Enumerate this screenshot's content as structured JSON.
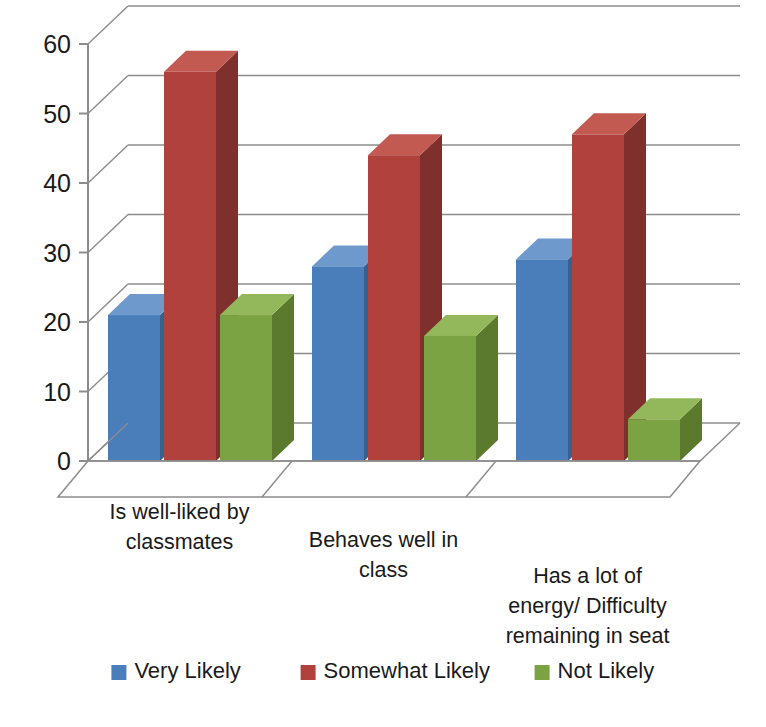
{
  "chart_data": {
    "type": "bar",
    "title": "",
    "subtitle": "",
    "xlabel": "",
    "ylabel": "",
    "ylim": [
      0,
      60
    ],
    "ytick_step": 10,
    "yticks": [
      "0",
      "10",
      "20",
      "30",
      "40",
      "50",
      "60"
    ],
    "grid": true,
    "style": "3d-clustered-column",
    "legend_position": "bottom",
    "categories": [
      "Is well-liked by classmates",
      "Behaves well in class",
      "Has a lot of energy/ Difficulty remaining in seat"
    ],
    "category_lines": [
      [
        "Is well-liked by",
        "classmates"
      ],
      [
        "Behaves well in",
        "class"
      ],
      [
        "Has a lot of",
        "energy/ Difficulty",
        "remaining in seat"
      ]
    ],
    "series": [
      {
        "name": "Very Likely",
        "color": "#4A7EBB",
        "values": [
          21,
          28,
          29
        ]
      },
      {
        "name": "Somewhat Likely",
        "color": "#B0413C",
        "values": [
          56,
          44,
          47
        ]
      },
      {
        "name": "Not Likely",
        "color": "#7CA343",
        "values": [
          21,
          18,
          6
        ]
      }
    ]
  },
  "legend": {
    "items": [
      {
        "label": "Very Likely",
        "color": "#4A7EBB"
      },
      {
        "label": "Somewhat Likely",
        "color": "#B0413C"
      },
      {
        "label": "Not Likely",
        "color": "#7CA343"
      }
    ]
  },
  "axis": {
    "y_ticks": [
      "60",
      "50",
      "40",
      "30",
      "20",
      "10",
      "0"
    ]
  },
  "colors": {
    "blue_face": "#4A7EBB",
    "blue_side": "#36608F",
    "blue_top": "#6E99CC",
    "red_face": "#B0413C",
    "red_side": "#80302C",
    "red_top": "#C25A52",
    "green_face": "#7CA343",
    "green_side": "#5B7A2E",
    "green_top": "#93B85C",
    "grid": "#8c8c8c",
    "axis": "#8c8c8c",
    "text": "#1a1a1a",
    "background": "#ffffff"
  }
}
